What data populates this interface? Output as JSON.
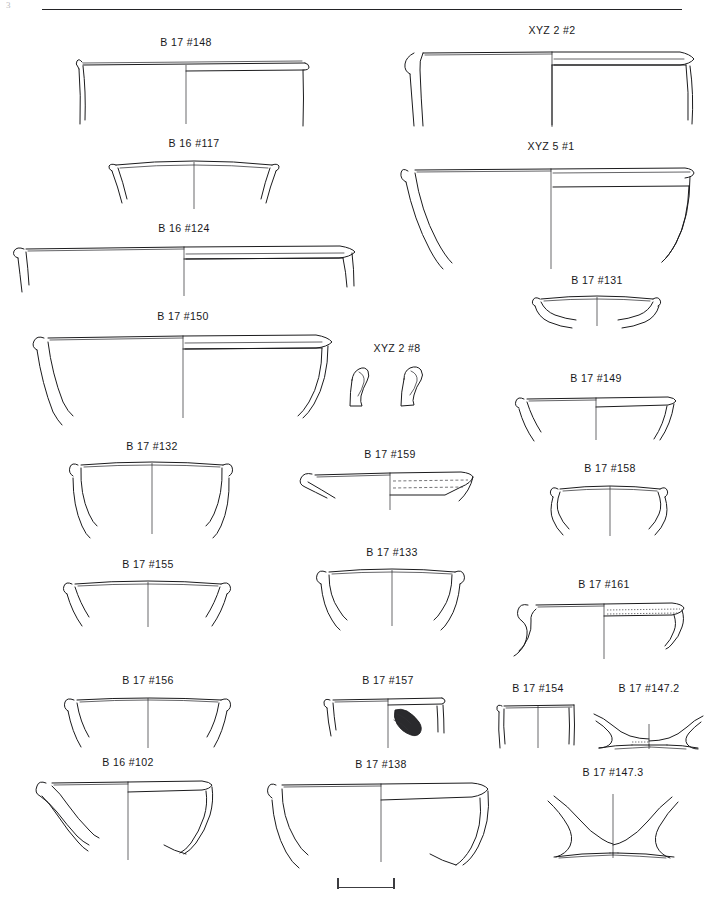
{
  "plate": {
    "title": "Archaeological pottery profile plate",
    "corner_mark": "3",
    "background_color": "#ffffff",
    "ink_color": "#1b1b1d",
    "width": 721,
    "height": 900
  },
  "top_rule": {
    "label": "header-rule",
    "x": 42,
    "y": 9,
    "width": 640
  },
  "scale_bar": {
    "label": "scale-bar",
    "x": 337,
    "y": 878,
    "width": 58,
    "tick_count": 2
  },
  "figures": [
    {
      "id": "b17-148",
      "label": "B 17 #148",
      "x": 62,
      "y": 36,
      "w": 248,
      "h": 92,
      "label_w": 248,
      "label_y": 0,
      "draw_y": 16,
      "vw": 248,
      "vh": 76,
      "rim_y": 12,
      "axis_x": 124,
      "half_w": 116,
      "notes": "wide shallow open bowl, everted rim, straight flaring wall"
    },
    {
      "id": "xyz2-2",
      "label": "XYZ 2 #2",
      "x": 402,
      "y": 24,
      "w": 300,
      "h": 105,
      "label_w": 300,
      "label_y": 0,
      "draw_y": 16,
      "vw": 300,
      "vh": 89,
      "rim_y": 14,
      "axis_x": 150,
      "half_w": 140,
      "notes": "large open bowl with thickened everted rim and interior ledge"
    },
    {
      "id": "b16-117",
      "label": "B 16 #117",
      "x": 96,
      "y": 137,
      "w": 196,
      "h": 80,
      "label_w": 196,
      "label_y": 0,
      "draw_y": 16,
      "vw": 196,
      "vh": 64,
      "rim_y": 10,
      "axis_x": 98,
      "half_w": 92,
      "notes": "small carinated bowl, incurving upper wall"
    },
    {
      "id": "xyz5-1",
      "label": "XYZ 5 #1",
      "x": 400,
      "y": 140,
      "w": 302,
      "h": 135,
      "label_w": 302,
      "label_y": 0,
      "draw_y": 17,
      "vw": 302,
      "vh": 118,
      "rim_y": 12,
      "axis_x": 151,
      "half_w": 146,
      "notes": "deep hemispherical bowl, simple rim, thick section"
    },
    {
      "id": "b16-124",
      "label": "B 16 #124",
      "x": 8,
      "y": 222,
      "w": 352,
      "h": 80,
      "label_w": 352,
      "label_y": 0,
      "draw_y": 16,
      "vw": 352,
      "vh": 64,
      "rim_y": 12,
      "axis_x": 176,
      "half_w": 170,
      "notes": "very wide shallow platter with flat rim"
    },
    {
      "id": "b17-131",
      "label": "B 17 #131",
      "x": 522,
      "y": 274,
      "w": 150,
      "h": 58,
      "label_w": 150,
      "label_y": 0,
      "draw_y": 16,
      "vw": 150,
      "vh": 42,
      "rim_y": 8,
      "axis_x": 75,
      "half_w": 60,
      "notes": "small shallow saucer fragment"
    },
    {
      "id": "b17-150",
      "label": "B 17 #150",
      "x": 26,
      "y": 310,
      "w": 314,
      "h": 112,
      "label_w": 314,
      "label_y": 0,
      "draw_y": 16,
      "vw": 314,
      "vh": 96,
      "rim_y": 12,
      "axis_x": 157,
      "half_w": 150,
      "notes": "wide deep basin, everted rim, flaring wall"
    },
    {
      "id": "xyz2-8",
      "label": "XYZ 2 #8",
      "x": 342,
      "y": 342,
      "w": 110,
      "h": 72,
      "label_w": 110,
      "label_y": 0,
      "draw_y": 22,
      "vw": 110,
      "vh": 50,
      "rim_y": 0,
      "axis_x": 55,
      "half_w": 50,
      "notes": "two small rim/base sherd fragments side by side"
    },
    {
      "id": "b17-149",
      "label": "B 17 #149",
      "x": 510,
      "y": 372,
      "w": 172,
      "h": 72,
      "label_w": 172,
      "label_y": 0,
      "draw_y": 16,
      "vw": 172,
      "vh": 56,
      "rim_y": 12,
      "axis_x": 86,
      "half_w": 80,
      "notes": "shallow bowl with flaring wall"
    },
    {
      "id": "b17-132",
      "label": "B 17 #132",
      "x": 62,
      "y": 440,
      "w": 180,
      "h": 98,
      "label_w": 180,
      "label_y": 0,
      "draw_y": 16,
      "vw": 180,
      "vh": 82,
      "rim_y": 8,
      "axis_x": 90,
      "half_w": 80,
      "notes": "deep rounded bowl, incurving profile"
    },
    {
      "id": "b17-159",
      "label": "B 17 #159",
      "x": 298,
      "y": 448,
      "w": 184,
      "h": 68,
      "label_w": 184,
      "label_y": 0,
      "draw_y": 16,
      "vw": 184,
      "vh": 52,
      "rim_y": 8,
      "axis_x": 92,
      "half_w": 84,
      "notes": "shallow dish with dashed interior decoration bands"
    },
    {
      "id": "b17-158",
      "label": "B 17 #158",
      "x": 540,
      "y": 462,
      "w": 140,
      "h": 78,
      "label_w": 140,
      "label_y": 0,
      "draw_y": 16,
      "vw": 140,
      "vh": 62,
      "rim_y": 10,
      "axis_x": 70,
      "half_w": 58,
      "notes": "small concave-walled cup"
    },
    {
      "id": "b17-155",
      "label": "B 17 #155",
      "x": 58,
      "y": 558,
      "w": 180,
      "h": 74,
      "label_w": 180,
      "label_y": 0,
      "draw_y": 16,
      "vw": 180,
      "vh": 58,
      "rim_y": 8,
      "axis_x": 90,
      "half_w": 80,
      "notes": "shallow bowl, slightly flaring rim"
    },
    {
      "id": "b17-133",
      "label": "B 17 #133",
      "x": 312,
      "y": 546,
      "w": 160,
      "h": 84,
      "label_w": 160,
      "label_y": 0,
      "draw_y": 16,
      "vw": 160,
      "vh": 68,
      "rim_y": 8,
      "axis_x": 80,
      "half_w": 72,
      "notes": "rounded bowl with slightly incurving rim"
    },
    {
      "id": "b17-161",
      "label": "B 17 #161",
      "x": 514,
      "y": 578,
      "w": 180,
      "h": 85,
      "label_w": 180,
      "label_y": 0,
      "draw_y": 16,
      "vw": 180,
      "vh": 69,
      "rim_y": 10,
      "axis_x": 90,
      "half_w": 82,
      "notes": "shallow platter with dotted rim band, grooved exterior"
    },
    {
      "id": "b17-156",
      "label": "B 17 #156",
      "x": 58,
      "y": 674,
      "w": 180,
      "h": 78,
      "label_w": 180,
      "label_y": 0,
      "draw_y": 16,
      "vw": 180,
      "vh": 62,
      "rim_y": 8,
      "axis_x": 90,
      "half_w": 80,
      "notes": "shallow bowl, near-straight wall"
    },
    {
      "id": "b17-157",
      "label": "B 17 #157",
      "x": 318,
      "y": 674,
      "w": 140,
      "h": 78,
      "label_w": 140,
      "label_y": 0,
      "draw_y": 16,
      "vw": 140,
      "vh": 62,
      "rim_y": 8,
      "axis_x": 70,
      "half_w": 62,
      "notes": "rim sherd with solid hatched spout/handle attachment"
    },
    {
      "id": "b17-154",
      "label": "B 17 #154",
      "x": 490,
      "y": 682,
      "w": 96,
      "h": 72,
      "label_w": 96,
      "label_y": 0,
      "draw_y": 16,
      "vw": 96,
      "vh": 56,
      "rim_y": 6,
      "axis_x": 48,
      "half_w": 40,
      "notes": "narrow cylindrical body sherd"
    },
    {
      "id": "b17-147-2",
      "label": "B 17 #147.2",
      "x": 590,
      "y": 682,
      "w": 118,
      "h": 72,
      "label_w": 118,
      "label_y": 0,
      "draw_y": 20,
      "vw": 118,
      "vh": 52,
      "rim_y": 0,
      "axis_x": 59,
      "half_w": 52,
      "notes": "low ring base profile"
    },
    {
      "id": "b16-102",
      "label": "B 16 #102",
      "x": 32,
      "y": 756,
      "w": 192,
      "h": 108,
      "label_w": 192,
      "label_y": 0,
      "draw_y": 16,
      "vw": 192,
      "vh": 92,
      "rim_y": 10,
      "axis_x": 96,
      "half_w": 86,
      "notes": "deep bowl with carinated lower body"
    },
    {
      "id": "b17-138",
      "label": "B 17 #138",
      "x": 266,
      "y": 758,
      "w": 230,
      "h": 108,
      "label_w": 230,
      "label_y": 0,
      "draw_y": 16,
      "vw": 230,
      "vh": 92,
      "rim_y": 10,
      "axis_x": 115,
      "half_w": 108,
      "notes": "large deep basin with rolled rim"
    },
    {
      "id": "b17-147-3",
      "label": "B 17 #147.3",
      "x": 530,
      "y": 766,
      "w": 166,
      "h": 98,
      "label_w": 166,
      "label_y": 0,
      "draw_y": 20,
      "vw": 166,
      "vh": 78,
      "rim_y": 0,
      "axis_x": 83,
      "half_w": 76,
      "notes": "splayed pedestal / ring base profile"
    }
  ]
}
